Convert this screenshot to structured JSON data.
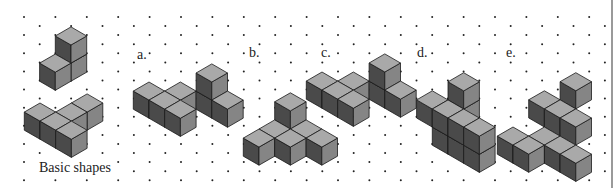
{
  "figure": {
    "caption": "Basic shapes",
    "colors": {
      "top": "#a9a9a9",
      "left": "#4a4a4a",
      "right": "#858585",
      "edge": "#1a1a1a",
      "dot": "#222222",
      "border": "#9a9a9a"
    },
    "grid": {
      "dx": 15.7,
      "dy": 9.07,
      "x0": 24,
      "y0": 17,
      "cols": 37,
      "rows": 19
    },
    "labels": [
      {
        "id": "a",
        "text": "a.",
        "x": 136,
        "y": 48
      },
      {
        "id": "b",
        "text": "b.",
        "x": 248,
        "y": 46
      },
      {
        "id": "c",
        "text": "c.",
        "x": 320,
        "y": 46
      },
      {
        "id": "d",
        "text": "d.",
        "x": 416,
        "y": 46
      },
      {
        "id": "e",
        "text": "e.",
        "x": 505,
        "y": 46
      }
    ],
    "shapes": [
      {
        "name": "basic-shape-1",
        "origin": [
          71,
          45
        ],
        "cubes": [
          [
            0,
            0,
            0
          ],
          [
            0,
            1,
            0
          ],
          [
            0,
            0,
            1
          ]
        ]
      },
      {
        "name": "basic-shape-2",
        "origin": [
          40,
          103
        ],
        "cubes": [
          [
            0,
            0,
            0
          ],
          [
            1,
            0,
            0
          ],
          [
            2,
            0,
            0
          ],
          [
            1,
            -1,
            0
          ],
          [
            1,
            -2,
            0
          ]
        ]
      },
      {
        "name": "option-a",
        "origin": [
          149,
          82
        ],
        "cubes": [
          [
            0,
            0,
            0
          ],
          [
            1,
            0,
            0
          ],
          [
            2,
            0,
            0
          ],
          [
            1,
            -1,
            0
          ],
          [
            2,
            -2,
            0
          ],
          [
            3,
            -2,
            0
          ],
          [
            2,
            -2,
            1
          ]
        ]
      },
      {
        "name": "option-b",
        "origin": [
          259,
          129
        ],
        "cubes": [
          [
            0,
            0,
            0
          ],
          [
            0,
            -1,
            0
          ],
          [
            1,
            -1,
            0
          ],
          [
            1,
            -2,
            0
          ],
          [
            2,
            -2,
            0
          ],
          [
            0,
            -2,
            1
          ]
        ]
      },
      {
        "name": "option-c",
        "origin": [
          322,
          72
        ],
        "cubes": [
          [
            0,
            0,
            0
          ],
          [
            1,
            0,
            0
          ],
          [
            2,
            0,
            0
          ],
          [
            1,
            -1,
            0
          ],
          [
            2,
            -2,
            0
          ],
          [
            3,
            -2,
            0
          ],
          [
            2,
            -2,
            1
          ]
        ]
      },
      {
        "name": "option-d",
        "origin": [
          448,
          118
        ],
        "cubes": [
          [
            0,
            0,
            0
          ],
          [
            1,
            0,
            0
          ],
          [
            2,
            0,
            0
          ],
          [
            0,
            0,
            1
          ],
          [
            1,
            0,
            1
          ],
          [
            2,
            0,
            1
          ],
          [
            0,
            -1,
            1
          ],
          [
            -1,
            0,
            1
          ],
          [
            0,
            -1,
            2
          ]
        ]
      },
      {
        "name": "option-e",
        "origin": [
          513,
          127
        ],
        "cubes": [
          [
            0,
            0,
            0
          ],
          [
            1,
            0,
            0
          ],
          [
            1,
            -1,
            0
          ],
          [
            2,
            -1,
            0
          ],
          [
            3,
            -1,
            0
          ],
          [
            1,
            -2,
            1
          ],
          [
            2,
            -2,
            1
          ],
          [
            0,
            -2,
            1
          ],
          [
            1,
            -3,
            2
          ]
        ]
      }
    ]
  }
}
